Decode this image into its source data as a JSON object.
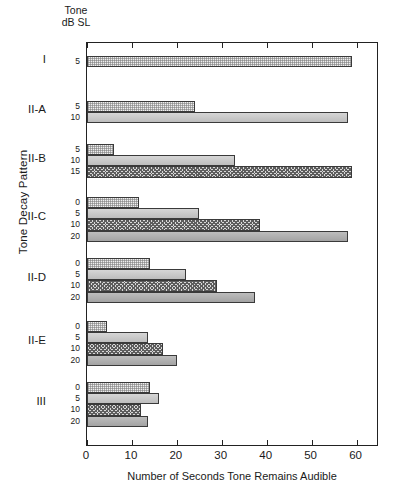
{
  "header": {
    "line1": "Tone",
    "line2": "dB SL"
  },
  "axes": {
    "ylabel": "Tone Decay Pattern",
    "xlabel": "Number of Seconds Tone Remains Audible",
    "xticks": [
      "0",
      "10",
      "20",
      "30",
      "40",
      "50",
      "60"
    ],
    "xlim": [
      0,
      65
    ]
  },
  "chart_data": {
    "type": "bar",
    "orientation": "horizontal",
    "title": "",
    "xlabel": "Number of Seconds Tone Remains Audible",
    "ylabel": "Tone Decay Pattern",
    "xlim": [
      0,
      65
    ],
    "grid": false,
    "legend": "none",
    "categories": [
      "I",
      "II-A",
      "II-B",
      "II-C",
      "II-D",
      "II-E",
      "III"
    ],
    "series_label": "Tone dB SL",
    "groups": [
      {
        "pattern": "I",
        "bars": [
          {
            "db": "5",
            "value": 59
          }
        ]
      },
      {
        "pattern": "II-A",
        "bars": [
          {
            "db": "5",
            "value": 24
          },
          {
            "db": "10",
            "value": 58
          }
        ]
      },
      {
        "pattern": "II-B",
        "bars": [
          {
            "db": "5",
            "value": 6
          },
          {
            "db": "10",
            "value": 33
          },
          {
            "db": "15",
            "value": 59
          }
        ]
      },
      {
        "pattern": "II-C",
        "bars": [
          {
            "db": "0",
            "value": 11.5
          },
          {
            "db": "5",
            "value": 25
          },
          {
            "db": "10",
            "value": 38.5
          },
          {
            "db": "20",
            "value": 58
          }
        ]
      },
      {
        "pattern": "II-D",
        "bars": [
          {
            "db": "0",
            "value": 14
          },
          {
            "db": "5",
            "value": 22
          },
          {
            "db": "10",
            "value": 29
          },
          {
            "db": "20",
            "value": 37.5
          }
        ]
      },
      {
        "pattern": "II-E",
        "bars": [
          {
            "db": "0",
            "value": 4.5
          },
          {
            "db": "5",
            "value": 13.5
          },
          {
            "db": "10",
            "value": 17
          },
          {
            "db": "20",
            "value": 20
          }
        ]
      },
      {
        "pattern": "III",
        "bars": [
          {
            "db": "0",
            "value": 14
          },
          {
            "db": "5",
            "value": 16
          },
          {
            "db": "10",
            "value": 12
          },
          {
            "db": "20",
            "value": 13.5
          }
        ]
      }
    ]
  },
  "style": {
    "axis_color": "#222222",
    "bar_border": "#3a3a3a",
    "fills": [
      "#efefef",
      "#c9c9c9",
      "#d8d8d8",
      "#b0b0b0"
    ]
  }
}
